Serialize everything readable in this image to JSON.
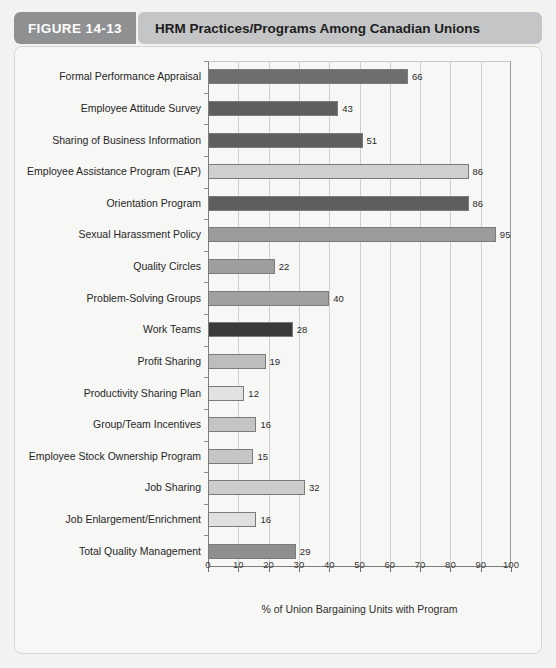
{
  "header": {
    "figure_label": "FIGURE 14-13",
    "title": "HRM Practices/Programs Among Canadian Unions",
    "tab_color": "#8e9092",
    "title_bg_color": "#c3c5c6"
  },
  "chart_data": {
    "type": "bar",
    "orientation": "horizontal",
    "title": "HRM Practices/Programs Among Canadian Unions",
    "xlabel": "% of Union Bargaining Units with Program",
    "ylabel": "",
    "xlim": [
      0,
      100
    ],
    "xticks": [
      0,
      10,
      20,
      30,
      40,
      50,
      60,
      70,
      80,
      90,
      100
    ],
    "grid": "vertical",
    "legend": "none",
    "categories": [
      "Formal Performance Appraisal",
      "Employee Attitude Survey",
      "Sharing of Business Information",
      "Employee Assistance Program (EAP)",
      "Orientation Program",
      "Sexual Harassment Policy",
      "Quality Circles",
      "Problem-Solving Groups",
      "Work Teams",
      "Profit Sharing",
      "Productivity Sharing Plan",
      "Group/Team Incentives",
      "Employee Stock Ownership Program",
      "Job Sharing",
      "Job Enlargement/Enrichment",
      "Total Quality Management"
    ],
    "values": [
      66,
      43,
      51,
      86,
      86,
      95,
      22,
      40,
      28,
      19,
      12,
      16,
      15,
      32,
      16,
      29
    ],
    "bar_colors": [
      "#6e6e6e",
      "#5e5e5e",
      "#5f5f5f",
      "#cfcfcf",
      "#5e5e5e",
      "#9b9b9b",
      "#9e9e9e",
      "#a0a0a0",
      "#3a3a3a",
      "#bdbdbd",
      "#e2e2e2",
      "#c4c4c4",
      "#c6c6c6",
      "#cccccc",
      "#e0e0e0",
      "#8f8f8f"
    ]
  }
}
